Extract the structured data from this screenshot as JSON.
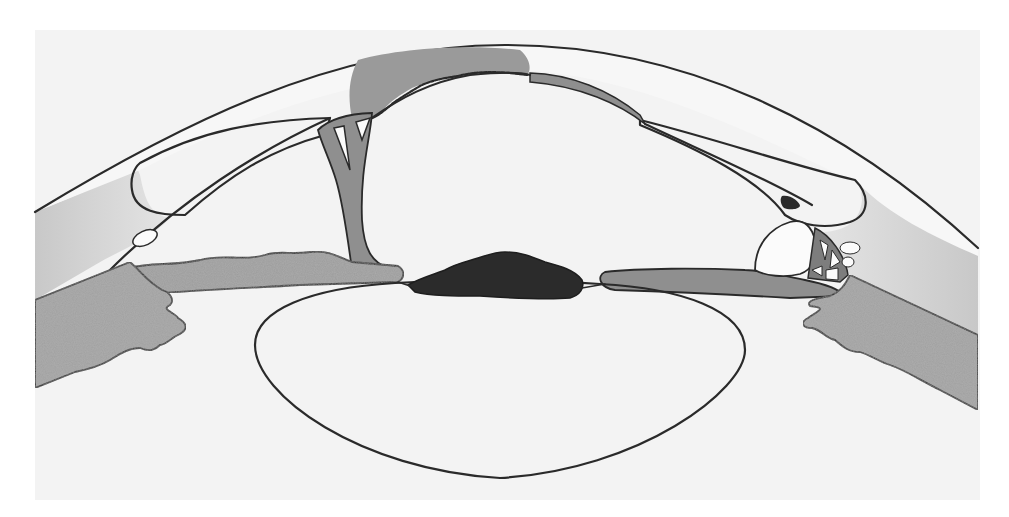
{
  "figure": {
    "type": "anatomical-diagram",
    "labels": [],
    "colors": {
      "page_background": "#ffffff",
      "panel_background": "#f3f3f3",
      "outline": "#2a2a2a",
      "light_grey_tissue": "#cfcfcf",
      "mid_grey_membrane": "#8f8f8f",
      "stippled_grey_iris_ciliary": "#9c9c9c",
      "dark_pupillary_mass": "#2b2b2b",
      "white_spaces": "#fbfbfb"
    },
    "structures": [
      {
        "id": "cornea",
        "description": "Outer curved corneal band spanning the top"
      },
      {
        "id": "anterior-chamber",
        "description": "Large white central chamber beneath the cornea"
      },
      {
        "id": "corneal-opacity",
        "description": "Grey blob at top centre under the cornea with scalloped lower edge"
      },
      {
        "id": "posterior-membrane-strip",
        "description": "Grey strip along inner corneal surface, right of centre"
      },
      {
        "id": "left-synechia",
        "description": "Grey branching band with small white triangular spaces connecting cornea to iris on the left"
      },
      {
        "id": "left-iris",
        "description": "Stippled grey iris on left, wavy anterior surface"
      },
      {
        "id": "right-iris",
        "description": "Smooth grey iris band on right"
      },
      {
        "id": "pupillary-exudate",
        "description": "Dark irregular mass over the pupil"
      },
      {
        "id": "lens",
        "description": "Large oval lens outline below the pupil"
      },
      {
        "id": "left-ciliary-body",
        "description": "Stippled grey ciliary body with folded processes, left"
      },
      {
        "id": "right-ciliary-body",
        "description": "Stippled grey ciliary body with folded processes, right"
      },
      {
        "id": "right-trabecular-meshwork",
        "description": "Network of small white compartments near the right angle"
      },
      {
        "id": "right-dark-spot",
        "description": "Small dark pigment spot near right angle"
      },
      {
        "id": "limbal-cavities",
        "description": "Small white oval spaces near each angle"
      }
    ]
  }
}
